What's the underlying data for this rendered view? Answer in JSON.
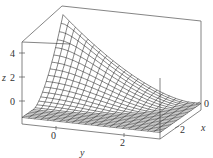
{
  "chart_data": {
    "type": "surface3d",
    "title": "",
    "axes": {
      "x": {
        "label": "x",
        "ticks": [
          "0",
          "2"
        ]
      },
      "y": {
        "label": "y",
        "ticks": [
          "0",
          "2"
        ]
      },
      "z": {
        "label": "z",
        "ticks": [
          "0",
          "2",
          "4"
        ],
        "range": [
          -1,
          5
        ]
      }
    },
    "grid": false,
    "legend": null,
    "colors": {
      "line": "#333333",
      "box": "#555555",
      "background": "#ffffff"
    }
  },
  "labels": {
    "z_axis": "z",
    "z4": "4",
    "z2": "2",
    "z0": "0",
    "y_axis": "y",
    "y0": "0",
    "y2": "2",
    "x_axis": "x",
    "x0": "0",
    "x2": "2"
  }
}
